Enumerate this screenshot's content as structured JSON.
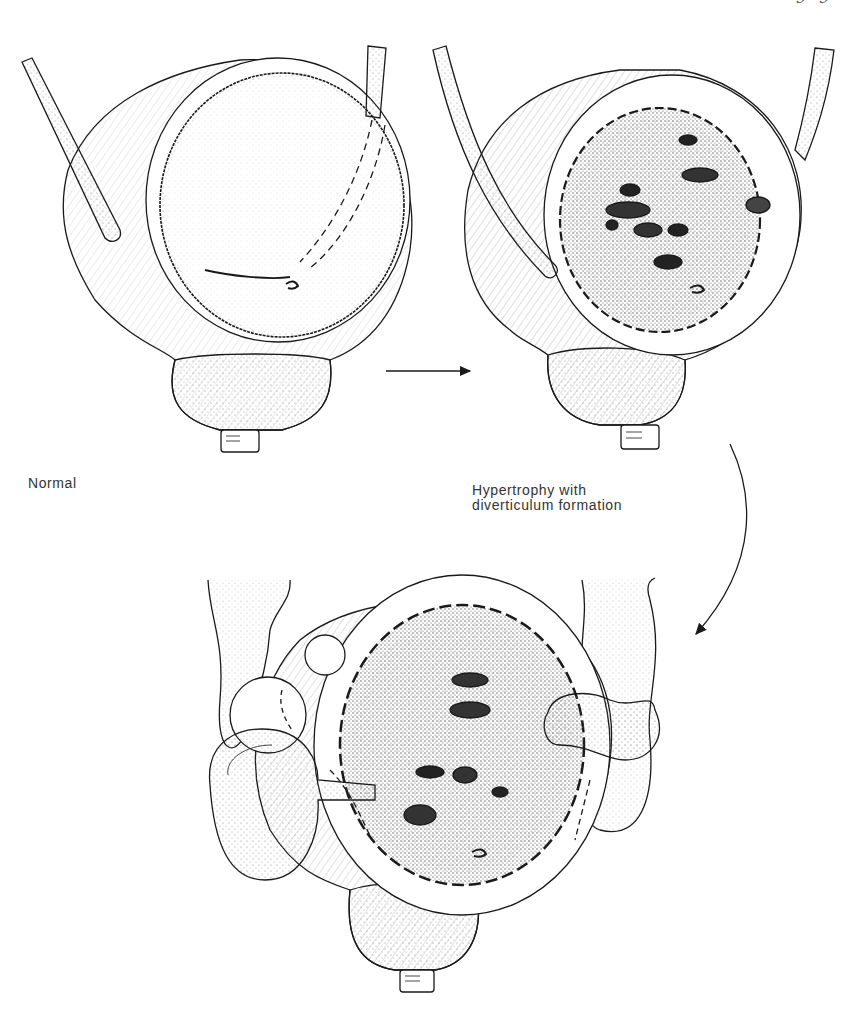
{
  "figure": {
    "page_number_fragment": "9 9",
    "panels": [
      {
        "id": "normal",
        "label": "Normal"
      },
      {
        "id": "hypertrophy",
        "label_lines": [
          "Hypertrophy with",
          "diverticulum formation"
        ]
      },
      {
        "id": "diverticula",
        "label": ""
      }
    ],
    "arrows": [
      {
        "id": "normal-to-hypertrophy",
        "type": "straight"
      },
      {
        "id": "hypertrophy-to-diverticula",
        "type": "curved"
      }
    ],
    "colors": {
      "ink": "#1a1a1a",
      "stipple": "#9a9a9a",
      "background": "#ffffff"
    }
  }
}
